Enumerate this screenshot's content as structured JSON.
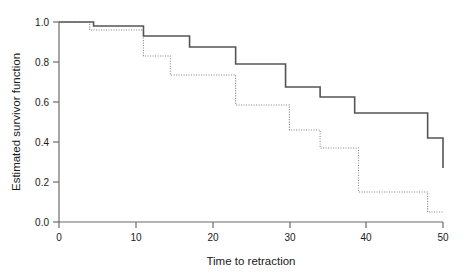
{
  "chart_data": {
    "type": "line",
    "title": "",
    "subtitle": "",
    "xlabel": "Time to retraction",
    "ylabel": "Estimated survivor function",
    "xlim": [
      0,
      50
    ],
    "ylim": [
      0.0,
      1.0
    ],
    "xticks": [
      0,
      10,
      20,
      30,
      40,
      50
    ],
    "xtick_labels": [
      "0",
      "10",
      "20",
      "30",
      "40",
      "50"
    ],
    "yticks": [
      0.0,
      0.2,
      0.4,
      0.6,
      0.8,
      1.0
    ],
    "ytick_labels": [
      "0.0",
      "0.2",
      "0.4",
      "0.6",
      "0.8",
      "1.0"
    ],
    "grid": false,
    "legend_position": "none",
    "step_style": "post",
    "series": [
      {
        "name": "Group 1 (solid)",
        "line_style": "solid",
        "color": "#555555",
        "line_width": 1.6,
        "x": [
          0,
          4.5,
          11.0,
          17.0,
          23.0,
          29.5,
          34.0,
          38.5,
          48.0,
          50.0
        ],
        "y": [
          1.0,
          0.98,
          0.93,
          0.875,
          0.79,
          0.675,
          0.625,
          0.545,
          0.42,
          0.27
        ]
      },
      {
        "name": "Group 2 (dotted)",
        "line_style": "dotted",
        "color": "#8c8c8c",
        "line_width": 1.1,
        "x": [
          0,
          4.0,
          11.0,
          14.5,
          23.0,
          30.0,
          34.0,
          39.0,
          48.0,
          50.0
        ],
        "y": [
          1.0,
          0.96,
          0.83,
          0.735,
          0.585,
          0.46,
          0.37,
          0.15,
          0.05,
          0.05
        ]
      }
    ]
  },
  "axes": {
    "x_axis_label": "Time to retraction",
    "y_axis_label": "Estimated survivor function"
  },
  "colors": {
    "background": "#ffffff",
    "axis": "#6b6b6b",
    "text": "#1a1a1a",
    "series_solid": "#555555",
    "series_dotted": "#8c8c8c"
  }
}
